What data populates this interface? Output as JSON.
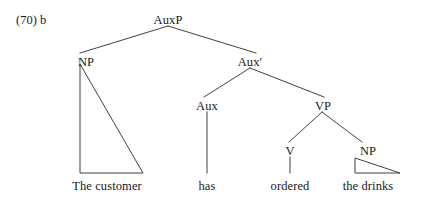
{
  "figure": {
    "example_number": "(70)  b",
    "type": "syntax-tree"
  },
  "nodes": {
    "root": {
      "label": "AuxP",
      "x": 168,
      "y": 20
    },
    "subject_np": {
      "label": "NP",
      "x": 86,
      "y": 62
    },
    "aux_bar": {
      "label": "Aux′",
      "x": 250,
      "y": 62
    },
    "aux_head": {
      "label": "Aux",
      "x": 207,
      "y": 106
    },
    "vp": {
      "label": "VP",
      "x": 323,
      "y": 106
    },
    "verb": {
      "label": "V",
      "x": 290,
      "y": 151
    },
    "object_np": {
      "label": "NP",
      "x": 368,
      "y": 151
    }
  },
  "terminals": {
    "subject": {
      "text": "The customer",
      "x": 107,
      "y": 187
    },
    "auxiliary": {
      "text": "has",
      "x": 207,
      "y": 187
    },
    "verb": {
      "text": "ordered",
      "x": 290,
      "y": 187
    },
    "object": {
      "text": "the drinks",
      "x": 368,
      "y": 187
    }
  },
  "sentence": "The customer has ordered the drinks",
  "colors": {
    "background": "#ffffff",
    "text": "#1a1a1a",
    "line": "#2b2b2b"
  }
}
